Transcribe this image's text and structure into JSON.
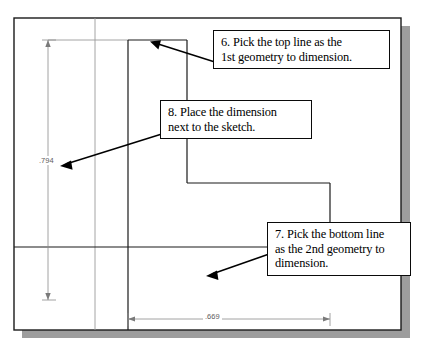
{
  "app": {
    "title": "Parametric Sketch Dimensioning Tutorial",
    "canvas_background": "#ffffff",
    "paper_border_color": "#1a1a1a",
    "shadow_color": "#9a9a9a",
    "sketch_line_color": "#1a1a1a",
    "construction_line_color": "#8a8a8a",
    "dimension_color": "#6e6e6e",
    "leader_color": "#000000"
  },
  "callouts": [
    {
      "id": "step-6",
      "line1": "6. Pick the top line as the",
      "line2": "1st geometry to dimension.",
      "target": "top-line"
    },
    {
      "id": "step-8",
      "line1": "8. Place the dimension",
      "line2": "next to the sketch.",
      "target": "vertical-dimension"
    },
    {
      "id": "step-7",
      "line1": "7. Pick the bottom line",
      "line2": "as the 2nd geometry to",
      "line3": "dimension.",
      "target": "bottom-line"
    }
  ],
  "dimensions": {
    "vertical": {
      "value": ".794",
      "units_note": "",
      "orientation": "vertical",
      "label": "vertical-dimension-value"
    },
    "horizontal": {
      "value": ".669",
      "orientation": "horizontal",
      "label": "horizontal-dimension-value"
    }
  },
  "geometry": {
    "description": "Stepped L-shaped profile sketch with construction grid lines",
    "sketch_top_y": 40,
    "sketch_bottom_y": 247,
    "sketch_left_x": 128,
    "sketch_right_x": 330
  }
}
